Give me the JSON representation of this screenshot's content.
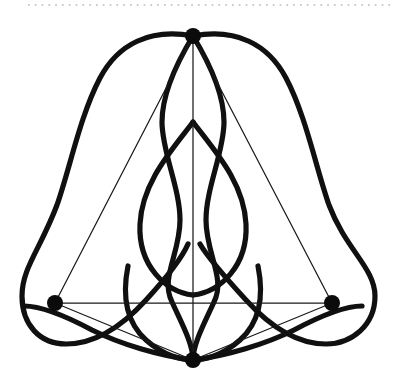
{
  "figure": {
    "title": "Knotted graph diagram",
    "background_color": "#ffffff",
    "curve_color": "#101010",
    "edge_color": "#1a1a1a",
    "vertex_color": "#0b0b0b",
    "scan_artifact_color": "#b9b9bd",
    "curve_stroke_width": 5.2,
    "edge_stroke_width": 1.25,
    "vertex_radius": 7.5
  },
  "chart_data": {
    "type": "diagram",
    "title": "Knotted graph diagram",
    "xlabel": "",
    "ylabel": "",
    "xlim": [
      0,
      411
    ],
    "ylim": [
      0,
      392
    ],
    "grid": false,
    "legend": "none",
    "vertices": [
      {
        "id": "top",
        "label": "top",
        "x": 193,
        "y": 36,
        "radius": 8
      },
      {
        "id": "left",
        "label": "left",
        "x": 55,
        "y": 303,
        "radius": 8
      },
      {
        "id": "right",
        "label": "right",
        "x": 332,
        "y": 303,
        "radius": 8
      },
      {
        "id": "bottom",
        "label": "bottom",
        "x": 193,
        "y": 360,
        "radius": 8
      }
    ],
    "straight_edges": [
      {
        "from": "top",
        "to": "bottom",
        "path": "M 193 36 L 193 360"
      },
      {
        "from": "top",
        "to": "left",
        "path": "M 193 36 L 55 303"
      },
      {
        "from": "top",
        "to": "right",
        "path": "M 193 36 L 332 303"
      },
      {
        "from": "left",
        "to": "right",
        "path": "M 55 303 L 332 303"
      },
      {
        "from": "left",
        "to": "bottom",
        "path": "M 55 303 L 193 360"
      },
      {
        "from": "right",
        "to": "bottom",
        "path": "M 332 303 L 193 360"
      }
    ],
    "thick_curves": [
      {
        "name": "outer-lobe-left",
        "path": "M 193 36 C 150 28 118 44 100 78 C 80 116 70 168 57 205 C 40 250 22 268 22 296 C 22 325 40 344 66 344 C 98 344 126 322 146 300 C 168 276 182 258 188 244"
      },
      {
        "name": "outer-lobe-right",
        "path": "M 193 36 C 236 28 268 44 286 78 C 306 116 316 168 329 205 C 346 250 375 268 375 296 C 375 325 352 344 326 344 C 294 344 266 322 246 300 C 224 276 208 258 200 244"
      },
      {
        "name": "inner-lens-left",
        "path": "M 193 36 C 176 64 162 94 162 122 C 162 152 180 188 180 220 C 180 254 160 278 172 302 C 182 324 193 344 193 360"
      },
      {
        "name": "inner-lens-right",
        "path": "M 193 36 C 210 64 224 94 224 122 C 224 152 206 188 206 220 C 206 254 226 278 214 302 C 204 324 193 344 193 360"
      },
      {
        "name": "mid-bulge-left",
        "path": "M 193 122 C 172 150 142 182 140 224 C 138 266 166 292 193 295"
      },
      {
        "name": "mid-bulge-right",
        "path": "M 193 122 C 214 150 244 182 246 224 C 248 266 220 292 193 295"
      },
      {
        "name": "bottom-petal-left",
        "path": "M 193 360 C 160 356 120 344 92 330 C 62 314 38 306 24 306"
      },
      {
        "name": "bottom-petal-right",
        "path": "M 193 360 C 226 356 266 344 294 330 C 324 314 348 306 362 306"
      },
      {
        "name": "left-hook",
        "path": "M 128 266 C 122 296 126 322 146 340 C 164 356 182 360 193 360"
      },
      {
        "name": "right-hook",
        "path": "M 258 266 C 264 296 260 322 240 340 C 222 356 204 360 193 360"
      }
    ],
    "scan_artifact": {
      "name": "dotted-scan-line",
      "path": "M 28 5 L 395 5",
      "dash": "1.7 5.1"
    }
  }
}
